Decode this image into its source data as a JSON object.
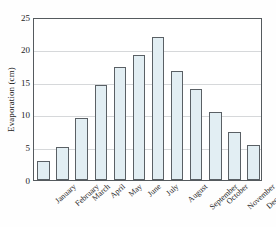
{
  "chart_data": {
    "type": "bar",
    "title": "",
    "xlabel": "",
    "ylabel": "Evaporation (cm)",
    "ylim": [
      0,
      25
    ],
    "yticks": [
      0,
      5,
      10,
      15,
      20,
      25
    ],
    "grid": true,
    "legend": null,
    "categories": [
      "January",
      "February",
      "March",
      "April",
      "May",
      "June",
      "July",
      "August",
      "September",
      "October",
      "November",
      "December"
    ],
    "values": [
      2.9,
      5.0,
      9.5,
      14.6,
      17.4,
      19.1,
      21.9,
      16.7,
      14.0,
      10.5,
      7.3,
      5.4
    ],
    "colors": {
      "bar_fill": "#e2eef3",
      "bar_edge": "#5a6065",
      "gridline": "#d6d8da",
      "frame": "#555a5e",
      "text": "#1d1d1d",
      "background": "#fefefe"
    }
  }
}
